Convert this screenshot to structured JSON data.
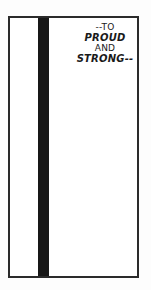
{
  "panel": {
    "caption": {
      "lines": [
        {
          "text": "--TO",
          "style": "plain"
        },
        {
          "text": "PROUD",
          "style": "emphasis"
        },
        {
          "text": "AND",
          "style": "plain"
        },
        {
          "text": "STRONG--",
          "style": "emphasis"
        }
      ],
      "full_text": "--TO PROUD AND STRONG--",
      "alignment": "center"
    },
    "colors": {
      "page_background": "#fdfdfd",
      "panel_background": "#ffffff",
      "border": "#2b2b2b",
      "divider_bar": "#181818",
      "text": "#1a1a1a"
    },
    "regions": {
      "left_column_label": "",
      "right_column_label": ""
    }
  }
}
